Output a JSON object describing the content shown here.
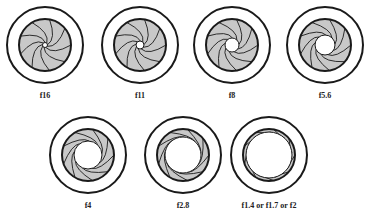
{
  "colors": {
    "line": "#1a1a1a",
    "blade": "#c8c8c8",
    "bg": "#ffffff"
  },
  "apertures": [
    {
      "label": "f16",
      "cx": 45,
      "cy": 45,
      "open": 2.5
    },
    {
      "label": "f11",
      "cx": 140,
      "cy": 45,
      "open": 4
    },
    {
      "label": "f8",
      "cx": 232,
      "cy": 45,
      "open": 7
    },
    {
      "label": "f5.6",
      "cx": 325,
      "cy": 45,
      "open": 10
    },
    {
      "label": "f4",
      "cx": 88,
      "cy": 155,
      "open": 14
    },
    {
      "label": "f2.8",
      "cx": 183,
      "cy": 155,
      "open": 18
    },
    {
      "label": "f1.4 or  f1.7 or  f2",
      "cx": 269,
      "cy": 155,
      "open": 23
    }
  ]
}
